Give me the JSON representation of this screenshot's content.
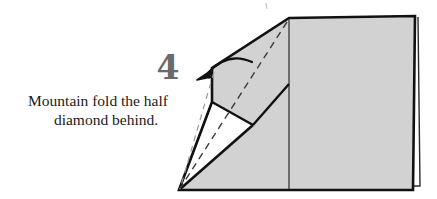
{
  "page": {
    "width": 437,
    "height": 199,
    "background_color": "#ffffff"
  },
  "step": {
    "number": "4",
    "number_color": "#6b6b6b",
    "instruction_line_1": "Mountain fold the half",
    "instruction_line_2": "diamond behind.",
    "instruction_full": "Mountain fold the half diamond behind.",
    "text_color": "#1a1a1a"
  },
  "diagram": {
    "paper_fill": "#d2d2d2",
    "paper_fill_white": "#ffffff",
    "outline_color": "#111111",
    "fold_line_color": "#3b3b3b",
    "arrow_color": "#111111",
    "arrow_label": "mountain-fold-arrow",
    "arrow_direction": "left-down",
    "dashed_fold_lines": 2,
    "shapes": {
      "main_panel": "large gray quadrilateral body",
      "flap": "gray upper-left flap quadrilateral",
      "white_wedge": "white triangular wedge at lower left",
      "edge_layer": "thin offset layer line at right edge"
    }
  }
}
